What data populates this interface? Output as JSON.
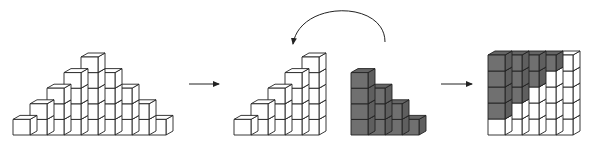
{
  "diagram": {
    "colors": {
      "background": "#ffffff",
      "cube_fill_white": "#ffffff",
      "cube_fill_gray": "#707070",
      "edge_color": "#222222",
      "arrow_color": "#222222"
    },
    "cube": {
      "width": 17,
      "height": 15.6,
      "depth_dx": 7,
      "depth_dy": 4
    },
    "figures": [
      {
        "id": "pyramid",
        "label": "Pyramid of cubes",
        "origin_x": 13,
        "base_y": 135,
        "column_heights": [
          1,
          2,
          3,
          4,
          5,
          4,
          3,
          2,
          1
        ],
        "fill": "white"
      },
      {
        "id": "left-staircase",
        "label": "Left half staircase",
        "origin_x": 234,
        "base_y": 135,
        "column_heights": [
          1,
          2,
          3,
          4,
          5
        ],
        "fill": "white"
      },
      {
        "id": "right-staircase",
        "label": "Right half staircase (shaded)",
        "origin_x": 351,
        "base_y": 135,
        "column_heights": [
          4,
          3,
          2,
          1
        ],
        "fill": "gray"
      },
      {
        "id": "square",
        "label": "Combined 5x5 square",
        "origin_x": 488,
        "base_y": 135,
        "cube_height": 16,
        "rows_top_to_bottom": [
          [
            "gray",
            "gray",
            "gray",
            "gray",
            "white"
          ],
          [
            "gray",
            "gray",
            "gray",
            "white",
            "white"
          ],
          [
            "gray",
            "gray",
            "white",
            "white",
            "white"
          ],
          [
            "gray",
            "white",
            "white",
            "white",
            "white"
          ],
          [
            "white",
            "white",
            "white",
            "white",
            "white"
          ]
        ]
      }
    ],
    "arrows": [
      {
        "id": "arrow-1",
        "type": "straight",
        "x1": 189,
        "y1": 84,
        "x2": 219,
        "y2": 84
      },
      {
        "id": "arrow-rotate",
        "type": "curved",
        "start": [
          385,
          42
        ],
        "control1": [
          385,
          0
        ],
        "control2": [
          300,
          0
        ],
        "end": [
          293,
          44
        ]
      },
      {
        "id": "arrow-2",
        "type": "straight",
        "x1": 441,
        "y1": 84,
        "x2": 472,
        "y2": 84
      }
    ]
  }
}
